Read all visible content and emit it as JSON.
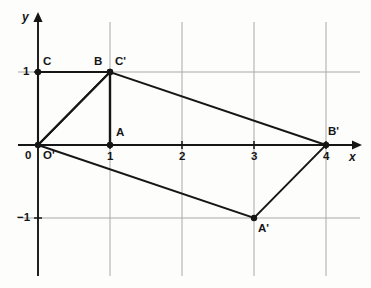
{
  "figure": {
    "background_color": "#fdfdfc",
    "ink_color": "#161616",
    "grid_color": "#a9a9a9"
  },
  "axes": {
    "x_label": "x",
    "y_label": "y",
    "origin_label": "0",
    "x_ticks": [
      "1",
      "2",
      "3",
      "4"
    ],
    "y_ticks": [
      "1",
      "−1"
    ],
    "x_range": [
      -0.28,
      4.45
    ],
    "y_range": [
      -1.9,
      1.8
    ],
    "arrowheads": true,
    "grid": true
  },
  "points": [
    {
      "name": "O",
      "label": "0",
      "x": 0,
      "y": 0,
      "dot": true,
      "label_dx": -13,
      "label_dy": 5
    },
    {
      "name": "Oprime",
      "label": "O'",
      "x": 0,
      "y": 0,
      "dot": false,
      "label_dx": 5,
      "label_dy": 5
    },
    {
      "name": "A",
      "label": "A",
      "x": 1,
      "y": 0,
      "dot": true,
      "label_dx": 6,
      "label_dy": -18
    },
    {
      "name": "B",
      "label": "B",
      "x": 1,
      "y": 1,
      "dot": true,
      "label_dx": -16,
      "label_dy": -16
    },
    {
      "name": "C",
      "label": "C",
      "x": 0,
      "y": 1,
      "dot": true,
      "label_dx": 5,
      "label_dy": -16
    },
    {
      "name": "Cprime",
      "label": "C'",
      "x": 1,
      "y": 1,
      "dot": true,
      "label_dx": 5,
      "label_dy": -16
    },
    {
      "name": "Aprime",
      "label": "A'",
      "x": 3,
      "y": -1,
      "dot": true,
      "label_dx": 4,
      "label_dy": 5
    },
    {
      "name": "Bprime",
      "label": "B'",
      "x": 4,
      "y": 0,
      "dot": true,
      "label_dx": 2,
      "label_dy": -19
    }
  ],
  "shapes": [
    {
      "name": "original-triangle",
      "type": "polyline",
      "vertices": [
        [
          0,
          0
        ],
        [
          1,
          1
        ],
        [
          0,
          1
        ]
      ],
      "closed": true,
      "stroke_width": 2.1
    },
    {
      "name": "segment-B-A",
      "type": "polyline",
      "vertices": [
        [
          1,
          1
        ],
        [
          1,
          0
        ]
      ],
      "closed": false,
      "stroke_width": 2.4
    },
    {
      "name": "image-quadrilateral",
      "type": "polyline",
      "vertices": [
        [
          0,
          0
        ],
        [
          1,
          1
        ],
        [
          4,
          0
        ],
        [
          3,
          -1
        ]
      ],
      "closed": true,
      "stroke_width": 1.9
    }
  ],
  "gridlines": {
    "vertical_x": [
      1,
      2,
      3,
      4
    ],
    "horizontal_y": [
      1,
      -1
    ]
  }
}
